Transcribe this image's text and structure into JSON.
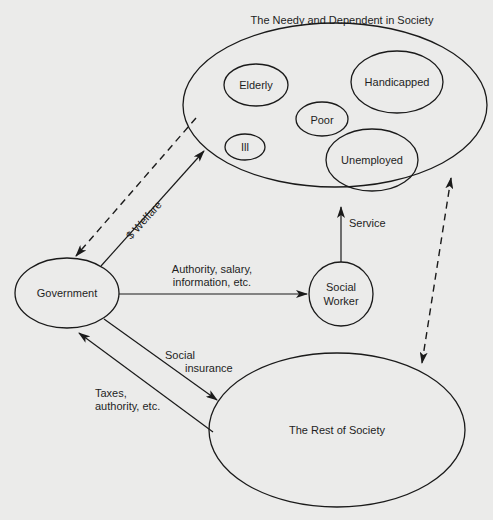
{
  "diagram": {
    "title": "The Needy and Dependent in Society",
    "nodes": {
      "needy_group": {
        "label": "The Needy and Dependent in Society"
      },
      "elderly": {
        "label": "Elderly"
      },
      "handicapped": {
        "label": "Handicapped"
      },
      "poor": {
        "label": "Poor"
      },
      "ill": {
        "label": "Ill"
      },
      "unemployed": {
        "label": "Unemployed"
      },
      "government": {
        "label": "Government"
      },
      "social_worker": {
        "line1": "Social",
        "line2": "Worker"
      },
      "rest_of_society": {
        "label": "The Rest of Society"
      }
    },
    "edges": {
      "welfare": {
        "label": "$ Welfare",
        "from": "Government",
        "to": "The Needy and Dependent in Society",
        "style": "solid"
      },
      "needy_to_government": {
        "from": "The Needy and Dependent in Society",
        "to": "Government",
        "style": "dashed"
      },
      "authority": {
        "line1": "Authority, salary,",
        "line2": "information, etc.",
        "from": "Government",
        "to": "Social Worker",
        "style": "solid"
      },
      "service": {
        "label": "Service",
        "from": "Social Worker",
        "to": "The Needy and Dependent in Society",
        "style": "solid"
      },
      "social_insurance": {
        "line1": "Social",
        "line2": "insurance",
        "from": "Government",
        "to": "The Rest of Society",
        "style": "solid"
      },
      "taxes": {
        "line1": "Taxes,",
        "line2": "authority, etc.",
        "from": "The Rest of Society",
        "to": "Government",
        "style": "solid"
      },
      "needy_rest": {
        "from": "The Needy and Dependent in Society",
        "to": "The Rest of Society",
        "style": "dashed-bidirectional"
      }
    }
  }
}
